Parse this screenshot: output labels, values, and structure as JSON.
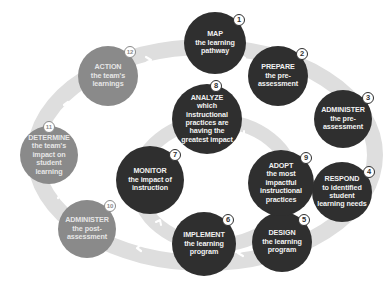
{
  "diagram": {
    "type": "cycle",
    "colors": {
      "dark_node": "#2f2f2f",
      "light_node": "#8a8a8a",
      "ring": "#dedede",
      "arrow": "#ffffff",
      "text": "#f2f2f2"
    },
    "steps": [
      {
        "number": "1",
        "head": "MAP",
        "rest": "the learning pathway",
        "tone": "dark"
      },
      {
        "number": "2",
        "head": "PREPARE",
        "rest": "the pre-assessment",
        "tone": "dark"
      },
      {
        "number": "3",
        "head": "ADMINISTER",
        "rest": "the pre-assessment",
        "tone": "dark"
      },
      {
        "number": "4",
        "head": "RESPOND",
        "rest": "to identified student learning needs",
        "tone": "dark"
      },
      {
        "number": "5",
        "head": "DESIGN",
        "rest": "the learning program",
        "tone": "dark"
      },
      {
        "number": "6",
        "head": "IMPLEMENT",
        "rest": "the learning program",
        "tone": "dark"
      },
      {
        "number": "7",
        "head": "MONITOR",
        "rest": "the impact of instruction",
        "tone": "dark"
      },
      {
        "number": "8",
        "head": "ANALYZE",
        "rest": "which instructional practices are having the greatest impact",
        "tone": "dark"
      },
      {
        "number": "9",
        "head": "ADOPT",
        "rest": "the most impactful instructional practices",
        "tone": "dark"
      },
      {
        "number": "10",
        "head": "ADMINISTER",
        "rest": "the post-assessment",
        "tone": "light"
      },
      {
        "number": "11",
        "head": "DETERMINE",
        "rest": "the team's impact on student learning",
        "tone": "light"
      },
      {
        "number": "12",
        "head": "ACTION",
        "rest": "the team's learnings",
        "tone": "light"
      }
    ]
  }
}
